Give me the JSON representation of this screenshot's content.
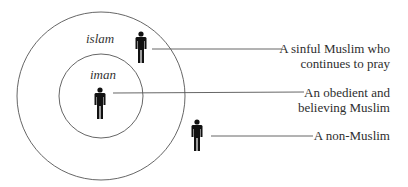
{
  "diagram": {
    "circles": [
      {
        "id": "outer",
        "label": "islam",
        "cx": 101,
        "cy": 96,
        "r": 84
      },
      {
        "id": "inner",
        "label": "iman",
        "cx": 101,
        "cy": 96,
        "r": 42
      }
    ],
    "figures": [
      {
        "id": "sinful-muslim",
        "region": "islam"
      },
      {
        "id": "obedient-muslim",
        "region": "iman"
      },
      {
        "id": "non-muslim",
        "region": "outside"
      }
    ],
    "callouts": {
      "sinful_line1": "A sinful Muslim who",
      "sinful_line2": "continues to pray",
      "obedient_line1": "An obedient and",
      "obedient_line2": "believing Muslim",
      "non_muslim": "A non-Muslim"
    },
    "labels": {
      "outer": "islam",
      "inner": "iman"
    },
    "colors": {
      "stroke": "#555555",
      "figure": "#111111",
      "text": "#2e2e2e"
    }
  }
}
